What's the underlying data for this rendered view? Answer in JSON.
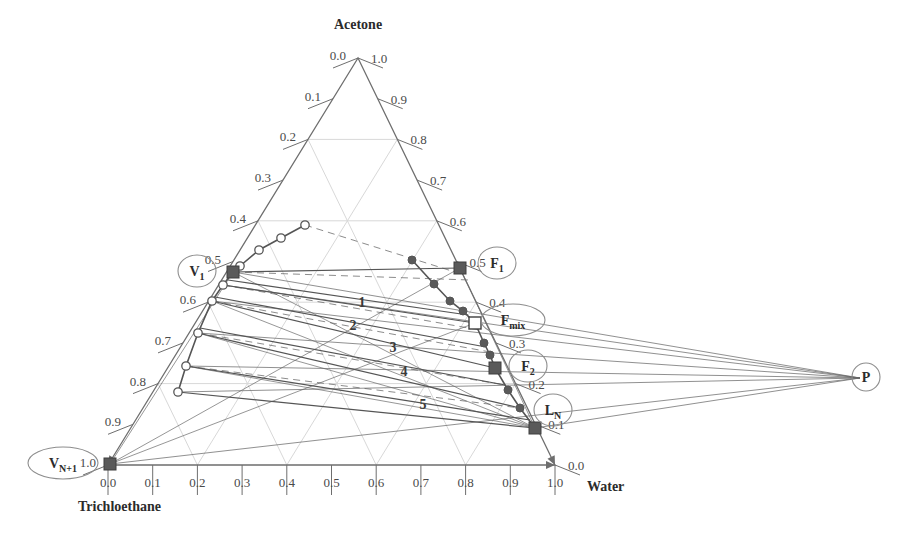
{
  "figure": {
    "type": "ternary-phase-diagram",
    "title": ""
  },
  "vertices": {
    "top": {
      "label": "Acetone",
      "x_px": 358,
      "y_px": 58
    },
    "bottom_left": {
      "label": "Trichloethane",
      "x_px": 108,
      "y_px": 465
    },
    "bottom_right": {
      "label": "Water",
      "x_px": 555,
      "y_px": 465
    }
  },
  "axes": {
    "bottom": {
      "name": "Water",
      "ticks": [
        "0.0",
        "0.1",
        "0.2",
        "0.3",
        "0.4",
        "0.5",
        "0.6",
        "0.7",
        "0.8",
        "0.9",
        "1.0"
      ],
      "direction": "left-to-right"
    },
    "left": {
      "name": "Acetone-left",
      "ticks": [
        "0.0",
        "0.1",
        "0.2",
        "0.3",
        "0.4",
        "0.5",
        "0.6",
        "0.7",
        "0.8",
        "0.9",
        "1.0"
      ],
      "direction": "top-to-bottom"
    },
    "right": {
      "name": "Acetone-right",
      "ticks": [
        "1.0",
        "0.9",
        "0.8",
        "0.7",
        "0.6",
        "0.5",
        "0.4",
        "0.3",
        "0.2",
        "0.1",
        "0.0"
      ],
      "direction": "top-to-bottom"
    }
  },
  "labeled_points": [
    {
      "id": "V1",
      "label": "V",
      "sub": "1",
      "marker": "filled-square",
      "x_px": 233,
      "y_px": 272,
      "callout_x": 197,
      "callout_y": 271
    },
    {
      "id": "VN1",
      "label": "V",
      "sub": "N+1",
      "marker": "filled-square",
      "x_px": 110,
      "y_px": 464,
      "callout_x": 63,
      "callout_y": 463
    },
    {
      "id": "F1",
      "label": "F",
      "sub": "1",
      "marker": "filled-square",
      "x_px": 460,
      "y_px": 268,
      "callout_x": 497,
      "callout_y": 263
    },
    {
      "id": "Fmix",
      "label": "F",
      "sub": "mix",
      "marker": "open-square",
      "x_px": 475,
      "y_px": 323,
      "callout_x": 513,
      "callout_y": 320
    },
    {
      "id": "F2",
      "label": "F",
      "sub": "2",
      "marker": "filled-square",
      "x_px": 495,
      "y_px": 368,
      "callout_x": 528,
      "callout_y": 366
    },
    {
      "id": "LN",
      "label": "L",
      "sub": "N",
      "marker": "filled-square",
      "x_px": 535,
      "y_px": 428,
      "callout_x": 553,
      "callout_y": 410
    },
    {
      "id": "P",
      "label": "P",
      "sub": "",
      "marker": "none",
      "x_px": 860,
      "y_px": 378,
      "callout_x": 866,
      "callout_y": 377
    }
  ],
  "stage_numbers": [
    {
      "label": "1",
      "x_px": 362,
      "y_px": 307
    },
    {
      "label": "2",
      "x_px": 353,
      "y_px": 330
    },
    {
      "label": "3",
      "x_px": 393,
      "y_px": 352
    },
    {
      "label": "4",
      "x_px": 404,
      "y_px": 376
    },
    {
      "label": "5",
      "x_px": 423,
      "y_px": 409
    }
  ],
  "chart_data": {
    "type": "scatter",
    "title": "",
    "xlabel": "Water",
    "ylabel": "Acetone",
    "binodal_left_branch": {
      "name": "extract-side binodal (open circles)",
      "marker": "open-circle",
      "points_px": [
        [
          305,
          225
        ],
        [
          281,
          238
        ],
        [
          259,
          250
        ],
        [
          240,
          266
        ],
        [
          233,
          272
        ],
        [
          223,
          285
        ],
        [
          212,
          301
        ],
        [
          198,
          333
        ],
        [
          186,
          366
        ],
        [
          178,
          392
        ]
      ]
    },
    "binodal_right_branch": {
      "name": "raffinate-side binodal (filled circles)",
      "marker": "filled-circle",
      "points_px": [
        [
          412,
          260
        ],
        [
          434,
          284
        ],
        [
          450,
          301
        ],
        [
          460,
          268
        ],
        [
          463,
          311
        ],
        [
          475,
          323
        ],
        [
          484,
          343
        ],
        [
          490,
          355
        ],
        [
          495,
          368
        ],
        [
          508,
          390
        ],
        [
          520,
          408
        ],
        [
          535,
          428
        ]
      ]
    },
    "right_branch_chain_px": [
      [
        412,
        260
      ],
      [
        434,
        284
      ],
      [
        450,
        301
      ],
      [
        463,
        311
      ],
      [
        475,
        323
      ],
      [
        484,
        343
      ],
      [
        490,
        355
      ],
      [
        495,
        368
      ],
      [
        508,
        390
      ],
      [
        520,
        408
      ],
      [
        535,
        428
      ]
    ],
    "left_branch_chain_px": [
      [
        305,
        225
      ],
      [
        281,
        238
      ],
      [
        259,
        250
      ],
      [
        240,
        266
      ],
      [
        233,
        272
      ],
      [
        223,
        285
      ],
      [
        212,
        301
      ],
      [
        198,
        333
      ],
      [
        186,
        366
      ],
      [
        178,
        392
      ]
    ],
    "tie_lines_px": [
      [
        [
          233,
          272
        ],
        [
          460,
          268
        ]
      ],
      [
        [
          228,
          280
        ],
        [
          468,
          315
        ]
      ],
      [
        [
          223,
          285
        ],
        [
          475,
          323
        ]
      ],
      [
        [
          215,
          297
        ],
        [
          486,
          347
        ]
      ],
      [
        [
          212,
          301
        ],
        [
          495,
          368
        ]
      ],
      [
        [
          200,
          328
        ],
        [
          505,
          385
        ]
      ],
      [
        [
          198,
          333
        ],
        [
          520,
          408
        ]
      ],
      [
        [
          186,
          366
        ],
        [
          530,
          420
        ]
      ],
      [
        [
          178,
          392
        ],
        [
          535,
          428
        ]
      ]
    ],
    "operating_lines_to_pole_px": [
      [
        [
          233,
          272
        ],
        [
          860,
          378
        ]
      ],
      [
        [
          223,
          285
        ],
        [
          860,
          378
        ]
      ],
      [
        [
          212,
          301
        ],
        [
          860,
          378
        ]
      ],
      [
        [
          198,
          333
        ],
        [
          860,
          378
        ]
      ],
      [
        [
          186,
          366
        ],
        [
          860,
          378
        ]
      ],
      [
        [
          178,
          392
        ],
        [
          860,
          378
        ]
      ],
      [
        [
          535,
          428
        ],
        [
          860,
          378
        ]
      ],
      [
        [
          110,
          464
        ],
        [
          860,
          378
        ]
      ]
    ],
    "construction_lines_px": [
      [
        [
          110,
          464
        ],
        [
          460,
          268
        ]
      ],
      [
        [
          110,
          464
        ],
        [
          475,
          323
        ]
      ],
      [
        [
          110,
          464
        ],
        [
          233,
          272
        ]
      ],
      [
        [
          233,
          272
        ],
        [
          535,
          428
        ]
      ],
      [
        [
          460,
          268
        ],
        [
          535,
          428
        ]
      ],
      [
        [
          212,
          301
        ],
        [
          535,
          428
        ]
      ],
      [
        [
          198,
          333
        ],
        [
          535,
          428
        ]
      ],
      [
        [
          186,
          366
        ],
        [
          535,
          428
        ]
      ]
    ],
    "dashed_lines_px": [
      [
        [
          233,
          272
        ],
        [
          470,
          280
        ]
      ],
      [
        [
          223,
          285
        ],
        [
          480,
          330
        ]
      ],
      [
        [
          212,
          301
        ],
        [
          490,
          352
        ]
      ],
      [
        [
          198,
          333
        ],
        [
          505,
          385
        ]
      ],
      [
        [
          186,
          366
        ],
        [
          520,
          408
        ]
      ],
      [
        [
          305,
          225
        ],
        [
          455,
          272
        ]
      ]
    ],
    "grid": "on",
    "grid_interval": 0.2,
    "legend_position": "none"
  },
  "colors": {
    "axis": "#6e6e6e",
    "grid": "#d8d8d8",
    "tie_line": "#555555",
    "operating_line": "#666666",
    "marker_fill": "#5a5a5a",
    "marker_open": "#ffffff",
    "text": "#2b2b2b",
    "tick_text": "#4a4a4a"
  }
}
